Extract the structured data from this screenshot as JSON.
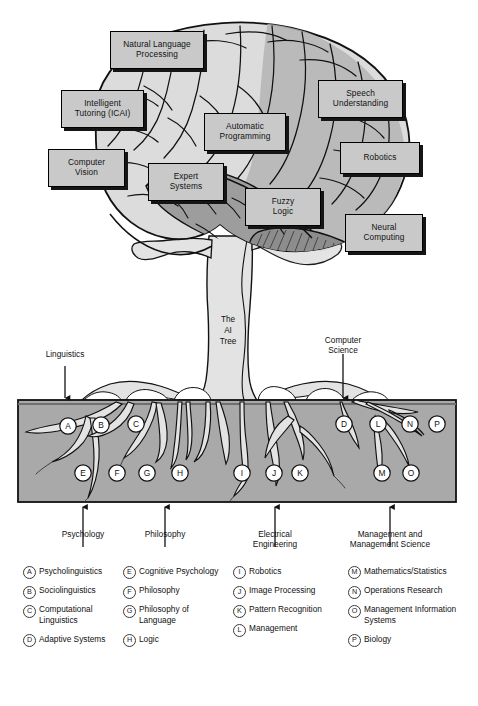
{
  "title": "The AI Tree",
  "colors": {
    "box_fill": "#c9c9c9",
    "box_border": "#000000",
    "box_shadow": "#151515",
    "brain_light": "#dcdcdc",
    "brain_mid": "#a8a8a8",
    "brain_dark": "#8a8a8a",
    "soil_fill": "#a9a9a9",
    "root_fill": "#e3e3e3",
    "outline": "#111111"
  },
  "brain_labels": [
    {
      "id": "natural-language-processing",
      "lines": [
        "Natural Language",
        "Processing"
      ],
      "x": 110,
      "y": 31,
      "w": 94,
      "h": 38
    },
    {
      "id": "intelligent-tutoring-icai",
      "lines": [
        "Intelligent",
        "Tutoring (ICAI)"
      ],
      "x": 61,
      "y": 90,
      "w": 83,
      "h": 38
    },
    {
      "id": "speech-understanding",
      "lines": [
        "Speech",
        "Understanding"
      ],
      "x": 318,
      "y": 80,
      "w": 85,
      "h": 38
    },
    {
      "id": "automatic-programming",
      "lines": [
        "Automatic",
        "Programming"
      ],
      "x": 204,
      "y": 113,
      "w": 82,
      "h": 38
    },
    {
      "id": "computer-vision",
      "lines": [
        "Computer",
        "Vision"
      ],
      "x": 48,
      "y": 149,
      "w": 77,
      "h": 38
    },
    {
      "id": "robotics",
      "lines": [
        "Robotics"
      ],
      "x": 340,
      "y": 142,
      "w": 80,
      "h": 32
    },
    {
      "id": "expert-systems",
      "lines": [
        "Expert",
        "Systems"
      ],
      "x": 148,
      "y": 163,
      "w": 76,
      "h": 38
    },
    {
      "id": "fuzzy-logic",
      "lines": [
        "Fuzzy",
        "Logic"
      ],
      "x": 245,
      "y": 188,
      "w": 76,
      "h": 38
    },
    {
      "id": "neural-computing",
      "lines": [
        "Neural",
        "Computing"
      ],
      "x": 345,
      "y": 214,
      "w": 78,
      "h": 38
    }
  ],
  "trunk_label": {
    "lines": [
      "The",
      "AI",
      "Tree"
    ],
    "x": 228,
    "y": 316
  },
  "top_arrows": [
    {
      "id": "linguistics",
      "label": "Linguistics",
      "label_x": 65,
      "label_y": 354,
      "arrow_x": 65,
      "arrow_y1": 369,
      "arrow_y2": 400
    },
    {
      "id": "computer-science",
      "label": "Computer\nScience",
      "lines": [
        "Computer",
        "Science"
      ],
      "label_x": 343,
      "label_y": 338,
      "arrow_x": 343,
      "arrow_y1": 369,
      "arrow_y2": 400
    }
  ],
  "bottom_arrows": [
    {
      "id": "psychology",
      "lines": [
        "Psychology"
      ],
      "x": 83,
      "label_y": 529,
      "arrow_y1": 547,
      "arrow_y2": 508
    },
    {
      "id": "philosophy",
      "lines": [
        "Philosophy"
      ],
      "x": 165,
      "label_y": 529,
      "arrow_y1": 547,
      "arrow_y2": 508
    },
    {
      "id": "electrical-engineering",
      "lines": [
        "Electrical",
        "Engineering"
      ],
      "x": 275,
      "label_y": 529,
      "arrow_y1": 547,
      "arrow_y2": 508
    },
    {
      "id": "management-and-management-science",
      "lines": [
        "Management and",
        "Management Science"
      ],
      "x": 390,
      "label_y": 529,
      "arrow_y1": 547,
      "arrow_y2": 508
    }
  ],
  "soil": {
    "x": 18,
    "y": 400,
    "w": 438,
    "h": 102
  },
  "root_markers": [
    {
      "letter": "A",
      "x": 68,
      "y": 426
    },
    {
      "letter": "B",
      "x": 101,
      "y": 425
    },
    {
      "letter": "C",
      "x": 136,
      "y": 424
    },
    {
      "letter": "D",
      "x": 344,
      "y": 424
    },
    {
      "letter": "L",
      "x": 378,
      "y": 424
    },
    {
      "letter": "N",
      "x": 410,
      "y": 424
    },
    {
      "letter": "P",
      "x": 437,
      "y": 424
    },
    {
      "letter": "E",
      "x": 83,
      "y": 473
    },
    {
      "letter": "F",
      "x": 117,
      "y": 473
    },
    {
      "letter": "G",
      "x": 147,
      "y": 473
    },
    {
      "letter": "H",
      "x": 180,
      "y": 473
    },
    {
      "letter": "I",
      "x": 242,
      "y": 473
    },
    {
      "letter": "J",
      "x": 274,
      "y": 473
    },
    {
      "letter": "K",
      "x": 300,
      "y": 473
    },
    {
      "letter": "M",
      "x": 382,
      "y": 473
    },
    {
      "letter": "O",
      "x": 411,
      "y": 473
    }
  ],
  "legend": {
    "columns": [
      {
        "x": 23,
        "width": 100,
        "items": [
          {
            "key": "A",
            "label": "Psycholinguistics"
          },
          {
            "key": "B",
            "label": "Sociolinguistics"
          },
          {
            "key": "C",
            "label": "Computational Linguistics"
          },
          {
            "key": "D",
            "label": "Adaptive Systems"
          }
        ]
      },
      {
        "x": 123,
        "width": 105,
        "items": [
          {
            "key": "E",
            "label": "Cognitive Psychology"
          },
          {
            "key": "F",
            "label": "Philosophy"
          },
          {
            "key": "G",
            "label": "Philosophy of Language"
          },
          {
            "key": "H",
            "label": "Logic"
          }
        ]
      },
      {
        "x": 233,
        "width": 112,
        "items": [
          {
            "key": "I",
            "label": "Robotics"
          },
          {
            "key": "J",
            "label": "Image Processing"
          },
          {
            "key": "K",
            "label": "Pattern Recognition"
          },
          {
            "key": "L",
            "label": "Management"
          }
        ]
      },
      {
        "x": 348,
        "width": 122,
        "items": [
          {
            "key": "M",
            "label": "Mathematics/Statistics"
          },
          {
            "key": "N",
            "label": "Operations Research"
          },
          {
            "key": "O",
            "label": "Management Information Systems"
          },
          {
            "key": "P",
            "label": "Biology"
          }
        ]
      }
    ]
  }
}
